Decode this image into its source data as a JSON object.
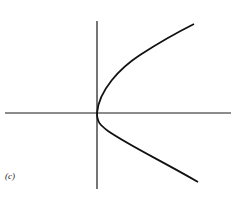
{
  "figure": {
    "label": "(c)",
    "colors": {
      "stroke": "#111111",
      "background": "#ffffff"
    }
  },
  "axes": {
    "horizontal": {
      "x1": 5,
      "x2": 231,
      "y": 113
    },
    "vertical": {
      "x": 97,
      "y1": 21,
      "y2": 189
    }
  },
  "curve": {
    "vertex": [
      97,
      113
    ],
    "upper_end": [
      194,
      24
    ],
    "lower_end": [
      198,
      182
    ]
  }
}
